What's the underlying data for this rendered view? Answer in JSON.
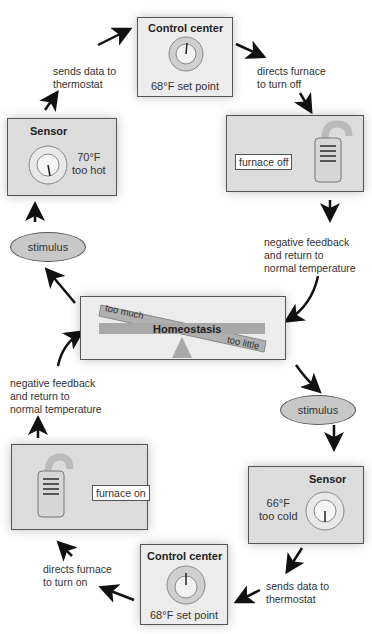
{
  "diagram": {
    "top_loop": {
      "control_center": {
        "title": "Control center",
        "set_point": "68°F set point"
      },
      "sensor": {
        "title": "Sensor",
        "reading": "70°F\ntoo hot"
      },
      "furnace": {
        "state": "furnace off"
      },
      "labels": {
        "sends_data": "sends data to\nthermostat",
        "directs_furnace": "directs furnace\nto turn off",
        "negative_feedback": "negative feedback\nand return to\nnormal temperature",
        "stimulus": "stimulus"
      }
    },
    "center": {
      "title": "Homeostasis",
      "too_much": "too much",
      "too_little": "too little"
    },
    "bottom_loop": {
      "control_center": {
        "title": "Control center",
        "set_point": "68°F set point"
      },
      "sensor": {
        "title": "Sensor",
        "reading": "66°F\ntoo cold"
      },
      "furnace": {
        "state": "furnace on"
      },
      "labels": {
        "sends_data": "sends data to\nthermostat",
        "directs_furnace": "directs furnace\nto turn on",
        "negative_feedback": "negative feedback\nand return to\nnormal temperature",
        "stimulus": "stimulus"
      }
    },
    "colors": {
      "box_fill": "#dcdcdc",
      "ellipse_fill": "#c8c8c8",
      "beam": "#a8a8a8",
      "border": "#555555"
    }
  }
}
